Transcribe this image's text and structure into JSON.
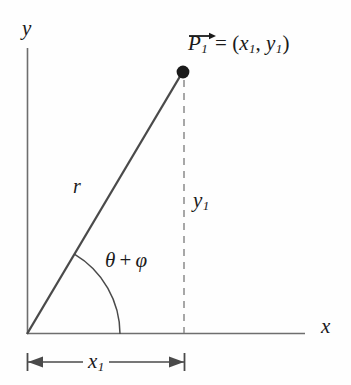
{
  "figure": {
    "type": "geometry-diagram",
    "background_color": "#fefefe",
    "line_color": "#555555",
    "ray_color": "#4a4a4a",
    "text_color": "#1a1a1a"
  },
  "axes": {
    "y_label": "y",
    "x_label": "x",
    "origin": {
      "x": 27,
      "y": 334
    },
    "x_axis_end": {
      "x": 305,
      "y": 334
    },
    "y_axis_top": {
      "x": 27,
      "y": 48
    }
  },
  "point": {
    "label_vector": "P",
    "label_subscript": "1",
    "equals": "=",
    "coordinates_open": "(",
    "coord_x": "x",
    "coord_x_sub": "1",
    "comma": ", ",
    "coord_y": "y",
    "coord_y_sub": "1",
    "coordinates_close": ")",
    "marker": {
      "x": 183,
      "y": 72,
      "radius": 6
    }
  },
  "ray": {
    "label": "r",
    "from": {
      "x": 27,
      "y": 334
    },
    "to": {
      "x": 183,
      "y": 72
    }
  },
  "angle": {
    "theta": "θ",
    "plus": "+",
    "phi": "φ",
    "arc_radius": 93,
    "start_deg": 0,
    "end_deg": 59.2
  },
  "drop_line": {
    "style": "dashed",
    "from": {
      "x": 184,
      "y": 80
    },
    "to": {
      "x": 184,
      "y": 333
    }
  },
  "measure_y1": {
    "label": "y",
    "subscript": "1"
  },
  "measure_x1": {
    "label": "x",
    "subscript": "1",
    "bracket_y": 362,
    "left_tick_x": 27,
    "right_tick_x": 184
  }
}
